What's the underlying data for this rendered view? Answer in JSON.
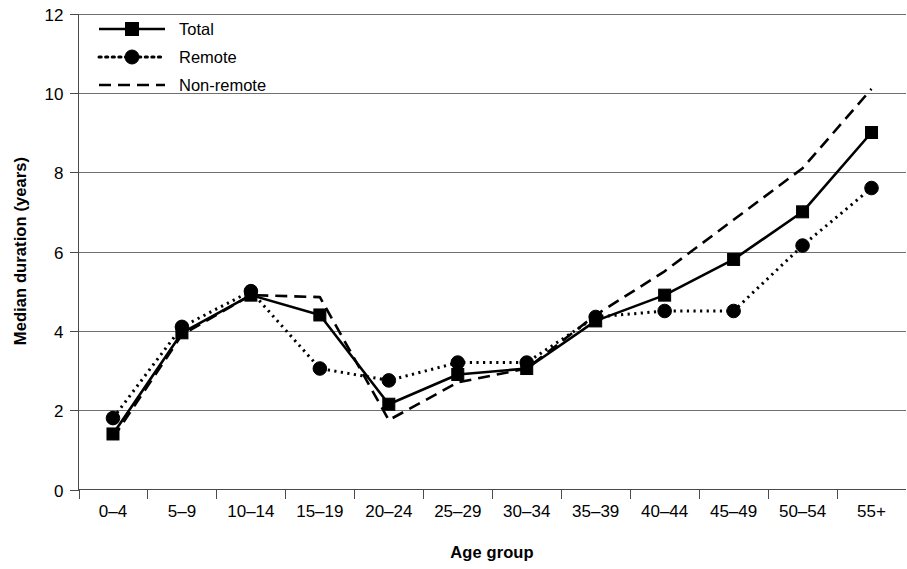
{
  "chart_data": {
    "type": "line",
    "title": "",
    "xlabel": "Age group",
    "ylabel": "Median duration (years)",
    "categories": [
      "0–4",
      "5–9",
      "10–14",
      "15–19",
      "20–24",
      "25–29",
      "30–34",
      "35–39",
      "40–44",
      "45–49",
      "50–54",
      "55+"
    ],
    "series": [
      {
        "name": "Total",
        "style": "solid",
        "marker": "square",
        "values": [
          1.4,
          3.95,
          4.9,
          4.4,
          2.15,
          2.9,
          3.05,
          4.25,
          4.9,
          5.8,
          7.0,
          9.0
        ]
      },
      {
        "name": "Remote",
        "style": "dotted",
        "marker": "circle",
        "values": [
          1.8,
          4.1,
          5.0,
          3.05,
          2.75,
          3.2,
          3.2,
          4.35,
          4.5,
          4.5,
          6.15,
          7.6
        ]
      },
      {
        "name": "Non-remote",
        "style": "dashed",
        "marker": "none",
        "values": [
          1.3,
          3.9,
          4.9,
          4.85,
          1.75,
          2.7,
          3.05,
          4.4,
          5.5,
          6.8,
          8.1,
          10.1
        ]
      }
    ],
    "ylim": [
      0,
      12
    ],
    "yticks": [
      0,
      2,
      4,
      6,
      8,
      10,
      12
    ],
    "ytick_labels": [
      "0",
      "2",
      "4",
      "6",
      "8",
      "10",
      "12"
    ],
    "grid": true,
    "grid_axis": "y",
    "legend_position": "top-left",
    "line_color": "#000000"
  },
  "legend": {
    "entries": [
      {
        "label": "Total"
      },
      {
        "label": "Remote"
      },
      {
        "label": "Non-remote"
      }
    ]
  }
}
